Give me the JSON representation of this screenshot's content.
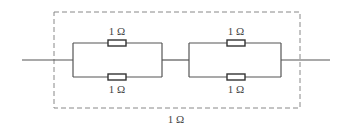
{
  "diagram": {
    "type": "circuit",
    "colors": {
      "wire": "#555555",
      "dashed_box": "#888888",
      "label": "#444444"
    },
    "blocks": [
      {
        "name": "parallel-block-1",
        "resistors": [
          {
            "position": "top",
            "label": "1 Ω"
          },
          {
            "position": "bottom",
            "label": "1 Ω"
          }
        ]
      },
      {
        "name": "parallel-block-2",
        "resistors": [
          {
            "position": "top",
            "label": "1 Ω"
          },
          {
            "position": "bottom",
            "label": "1 Ω"
          }
        ]
      }
    ],
    "equivalent_label": "1 Ω"
  }
}
